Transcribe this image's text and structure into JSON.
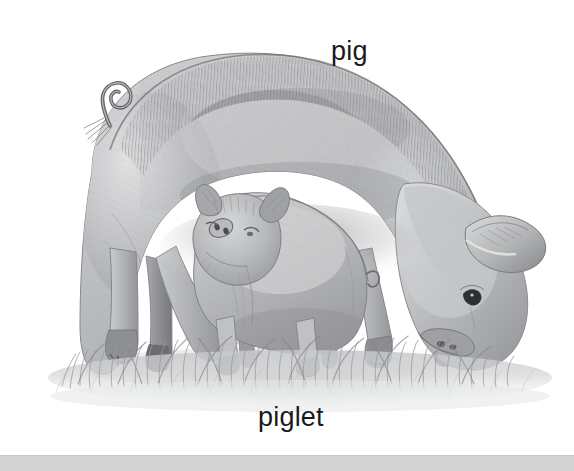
{
  "scene": {
    "title": "pig and piglet pencil illustration",
    "medium": "graphite pencil drawing",
    "palette": "grayscale",
    "background_color": "#ffffff",
    "width": 574,
    "height": 471
  },
  "labels": {
    "pig": "pig",
    "piglet": "piglet",
    "text_color": "#1a1a1a",
    "font_size_px": 27
  },
  "subjects": [
    {
      "name": "pig",
      "description": "adult sow standing with head lowered to graze at right",
      "label": "pig",
      "label_position": "top-right",
      "features": [
        "curly tail",
        "bristled spine",
        "floppy ear",
        "snout",
        "four legs with cloven hooves"
      ]
    },
    {
      "name": "piglet",
      "description": "young piglet standing beneath the adult pig facing left",
      "label": "piglet",
      "label_position": "bottom-center",
      "features": [
        "upright ears",
        "snout",
        "short legs",
        "small body"
      ]
    }
  ],
  "ground": {
    "name": "grass",
    "description": "tufted grass and soft ground shadow across the lower area",
    "color": "#b9babc"
  },
  "bottom_bar": {
    "name": "bottom-bar",
    "color": "#d3d3d4",
    "height_px": 15
  }
}
